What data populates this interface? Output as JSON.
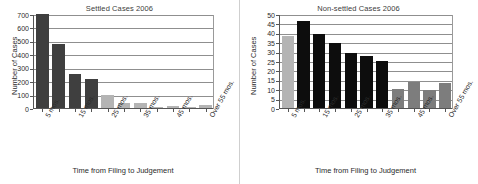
{
  "figure": {
    "divider_present": true,
    "colors": {
      "dark": "#3f3f3f",
      "black": "#0d0d0d",
      "mid_gray": "#7d7d7d",
      "light_gray": "#b4b4b4",
      "axis": "#555555",
      "grid": "#8f8f8f"
    }
  },
  "chart_data": [
    {
      "type": "bar",
      "title": "Settled Cases 2006",
      "xlabel": "Time from Filing to Judgement",
      "ylabel": "Number of Cases",
      "ylim": [
        0,
        700
      ],
      "yticks": [
        0,
        100,
        200,
        300,
        400,
        500,
        600,
        700
      ],
      "grid": true,
      "legend": "none",
      "categories": [
        "5 mos.",
        "15 mos.",
        "25 mos.",
        "35 mos.",
        "45 mos.",
        "Over 55 mos."
      ],
      "tick_positions": [
        0,
        2,
        4,
        6,
        8,
        10
      ],
      "values": [
        700,
        480,
        250,
        218,
        95,
        40,
        40,
        10,
        15,
        8,
        25
      ],
      "bar_colors": [
        "dark",
        "dark",
        "dark",
        "dark",
        "light_gray",
        "light_gray",
        "light_gray",
        "light_gray",
        "light_gray",
        "light_gray",
        "light_gray"
      ]
    },
    {
      "type": "bar",
      "title": "Non-settled Cases 2006",
      "xlabel": "Time from Filing to Judgement",
      "ylabel": "Number of Cases",
      "ylim": [
        0,
        50
      ],
      "yticks": [
        0,
        5,
        10,
        15,
        20,
        25,
        30,
        35,
        40,
        45,
        50
      ],
      "grid": true,
      "legend": "none",
      "categories": [
        "5 mos.",
        "15 mos.",
        "25 mos.",
        "35 mos.",
        "45 mos.",
        "Over 55 mos."
      ],
      "tick_positions": [
        0,
        2,
        4,
        6,
        8,
        10
      ],
      "values": [
        38.5,
        46.5,
        39.5,
        34.5,
        29,
        27.5,
        24.8,
        10,
        14,
        9.6,
        13.2
      ],
      "bar_colors": [
        "light_gray",
        "black",
        "black",
        "black",
        "black",
        "black",
        "black",
        "mid_gray",
        "mid_gray",
        "mid_gray",
        "mid_gray"
      ]
    }
  ]
}
